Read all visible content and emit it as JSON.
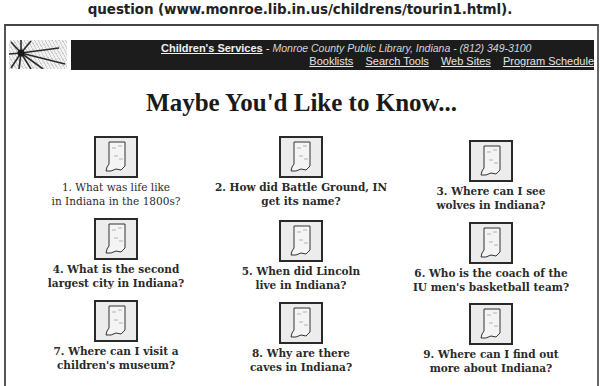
{
  "caption": "question (www.monroe.lib.in.us/childrens/tourin1.html).",
  "banner": {
    "service_link": "Children's Services",
    "separator": " - ",
    "library_info": "Monroe County Public Library, Indiana - (812) 349-3100",
    "nav": [
      {
        "label": "Booklists"
      },
      {
        "label": "Search Tools"
      },
      {
        "label": "Web Sites"
      },
      {
        "label": "Program Schedule"
      }
    ]
  },
  "headline": "Maybe You'd Like to Know...",
  "icon": "indiana-map-icon",
  "questions": [
    {
      "line1": "1. What was life like",
      "line2": "in Indiana in the 1800s?"
    },
    {
      "line1": "2. How did Battle Ground, IN",
      "line2": "get its name?"
    },
    {
      "line1": "3. Where can I see",
      "line2": "wolves in Indiana?"
    },
    {
      "line1": "4. What is the second",
      "line2": "largest city in Indiana?"
    },
    {
      "line1": "5. When did Lincoln",
      "line2": "live in Indiana?"
    },
    {
      "line1": "6. Who is the coach of the",
      "line2": "IU men's basketball team?"
    },
    {
      "line1": "7. Where can I visit a",
      "line2": "children's museum?"
    },
    {
      "line1": "8. Why are there",
      "line2": "caves in Indiana?"
    },
    {
      "line1": "9. Where can I find out",
      "line2": "more about Indiana?"
    }
  ],
  "colors": {
    "banner_bg": "#1c1c1c",
    "banner_text": "#e8e8e8",
    "page_bg": "#ffffff",
    "text": "#1a1a1a"
  }
}
